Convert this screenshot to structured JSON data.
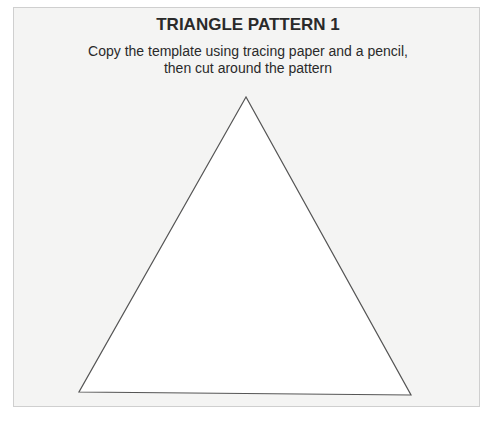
{
  "document": {
    "title": "TRIANGLE PATTERN 1",
    "instructions_line1": "Copy the template using tracing paper and a pencil,",
    "instructions_line2": "then cut around the pattern"
  },
  "shape": {
    "type": "triangle",
    "points": "246,97 79,392 411,395",
    "fill": "#ffffff",
    "stroke": "#555555"
  }
}
